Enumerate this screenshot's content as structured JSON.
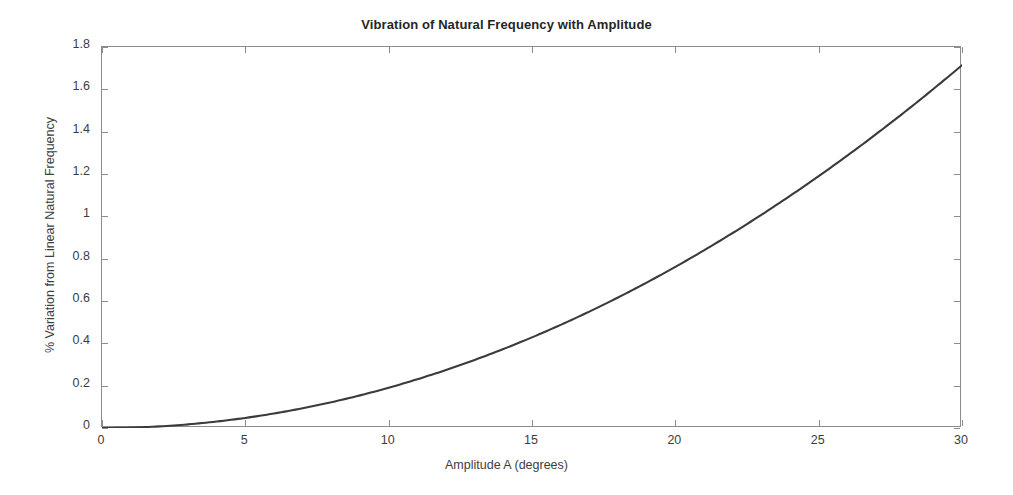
{
  "figure": {
    "background_color": "#ffffff",
    "axis_color": "#8c8c8c",
    "text_color": "#3d3d3d"
  },
  "chart_data": {
    "type": "line",
    "title": "Vibration of Natural Frequency with Amplitude",
    "xlabel": "Amplitude A (degrees)",
    "ylabel": "% Variation from Linear Natural Frequency",
    "xlim": [
      0,
      30
    ],
    "ylim": [
      0,
      1.8
    ],
    "xticks": [
      0,
      5,
      10,
      15,
      20,
      25,
      30
    ],
    "xtick_labels": [
      "0",
      "5",
      "10",
      "15",
      "20",
      "25",
      "30"
    ],
    "yticks": [
      0,
      0.2,
      0.4,
      0.6,
      0.8,
      1,
      1.2,
      1.4,
      1.6,
      1.8
    ],
    "ytick_labels": [
      "0",
      "0.2",
      "0.4",
      "0.6",
      "0.8",
      "1",
      "1.2",
      "1.4",
      "1.6",
      "1.8"
    ],
    "grid": false,
    "legend": null,
    "box": true,
    "tick_direction": "in",
    "series": [
      {
        "name": "% variation",
        "color": "#3b3b3b",
        "line_width": 2.1,
        "x": [
          0,
          1,
          2,
          3,
          4,
          5,
          6,
          7,
          8,
          9,
          10,
          11,
          12,
          13,
          14,
          15,
          16,
          17,
          18,
          19,
          20,
          21,
          22,
          23,
          24,
          25,
          26,
          27,
          28,
          29,
          30
        ],
        "y": [
          0,
          0.0019,
          0.0076,
          0.0171,
          0.0305,
          0.0476,
          0.0686,
          0.0933,
          0.1218,
          0.1542,
          0.1903,
          0.2303,
          0.2741,
          0.3216,
          0.373,
          0.4282,
          0.4872,
          0.55,
          0.6166,
          0.6871,
          0.7613,
          0.8394,
          0.9213,
          1.007,
          1.0966,
          1.1899,
          1.2871,
          1.3881,
          1.493,
          1.6016,
          1.7141
        ]
      }
    ]
  }
}
